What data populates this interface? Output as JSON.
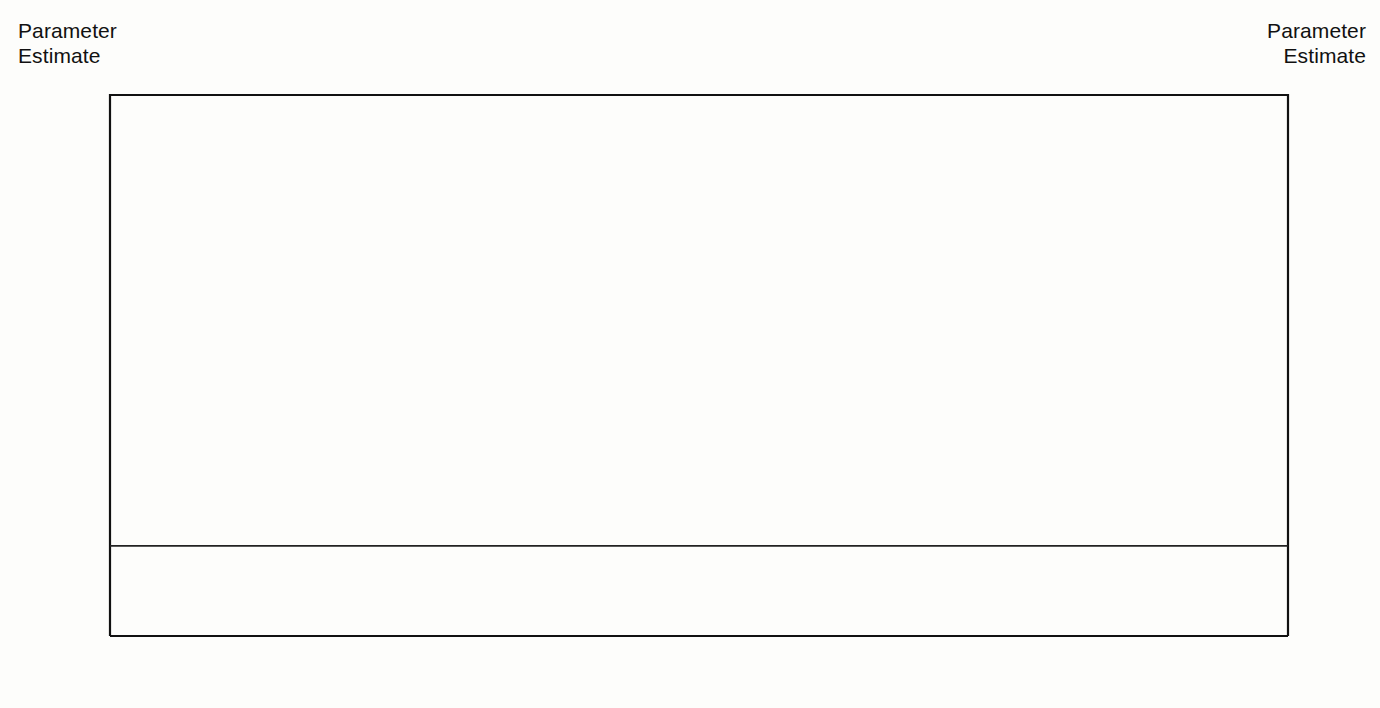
{
  "axis_titles": {
    "left": "Parameter\nEstimate",
    "right": "Parameter\nEstimate"
  },
  "chart_data": {
    "type": "line",
    "title": "",
    "subtitle": "",
    "xlabel": "",
    "ylabel": "Parameter Estimate",
    "ylabel_right": "Parameter Estimate",
    "grid": false,
    "legend": "none",
    "xlim": [
      1990,
      2008
    ],
    "ylim": [
      -0.02,
      0.1
    ],
    "ytick_labels": [
      "0.10",
      "0.08",
      "0.06",
      "0.04",
      "0.02",
      "0.00",
      "-0.02"
    ],
    "ytick_values": [
      0.1,
      0.08,
      0.06,
      0.04,
      0.02,
      0.0,
      -0.02
    ],
    "yminor_values": [
      0.09,
      0.07,
      0.05,
      0.03,
      0.01,
      -0.01
    ],
    "zero_reference_line": 0.0,
    "x": [
      1990,
      1991,
      1992,
      1993,
      1994,
      1995,
      1996,
      1997,
      1998,
      1999,
      2000,
      2001,
      2002,
      2003,
      2004,
      2005,
      2006,
      2007,
      2008
    ],
    "categories": [
      "1990",
      "1991",
      "1992",
      "1993",
      "1994",
      "1995",
      "1996",
      "1997",
      "1998",
      "1999",
      "2000",
      "2001",
      "2002",
      "2003",
      "2004",
      "2005",
      "2006",
      "2007",
      "2008"
    ],
    "series": [
      {
        "name": "Parameter estimate",
        "style": "solid",
        "values": [
          0.014,
          0.0135,
          0.0145,
          0.0198,
          0.021,
          0.023,
          0.033,
          0.034,
          0.048,
          0.0535,
          0.047,
          0.0467,
          0.0738,
          0.0593,
          0.059,
          0.0562,
          0.057,
          0.0457,
          0.07
        ]
      },
      {
        "name": "Upper confidence bound",
        "style": "dashed",
        "values": [
          0.028,
          0.0267,
          0.0268,
          0.0345,
          0.04,
          0.0425,
          0.047,
          0.052,
          0.0705,
          0.079,
          0.067,
          0.0648,
          0.0943,
          0.0805,
          0.0807,
          0.0772,
          0.0775,
          0.0638,
          0.09
        ]
      },
      {
        "name": "Lower confidence bound",
        "style": "dashed",
        "values": [
          0.0,
          0.0013,
          0.0,
          0.0023,
          0.0032,
          0.005,
          0.0145,
          0.0147,
          0.0263,
          0.0272,
          0.0255,
          0.0272,
          0.0523,
          0.0392,
          0.0382,
          0.0368,
          0.0365,
          0.0283,
          0.0513
        ]
      }
    ]
  },
  "colors": {
    "line": "#0b0b0b",
    "axis": "#111111",
    "background": "#fdfdfb"
  }
}
